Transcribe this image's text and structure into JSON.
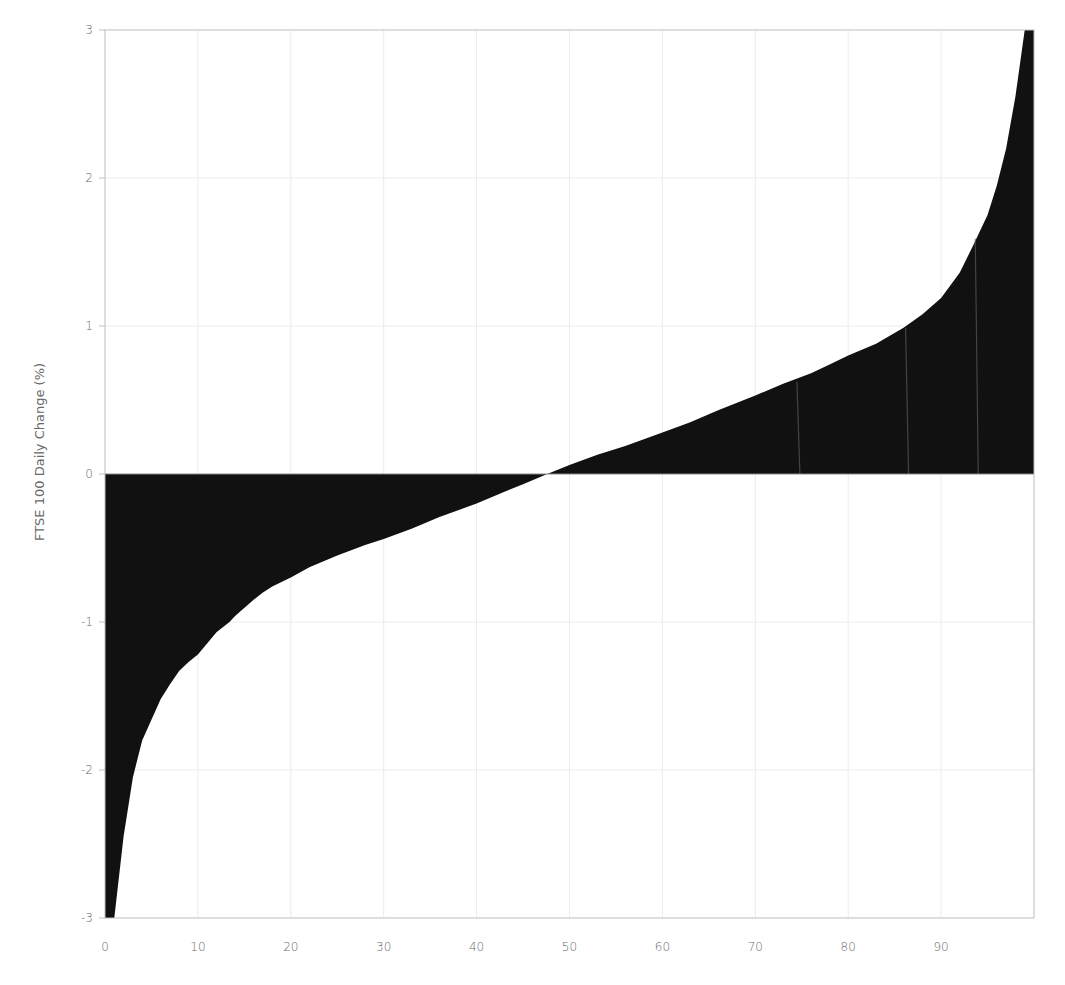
{
  "chart_data": {
    "type": "area",
    "title": "",
    "xlabel": "",
    "ylabel": "FTSE 100 Daily Change (%)",
    "xlim": [
      0,
      100
    ],
    "ylim": [
      -3,
      3
    ],
    "x_ticks": [
      0,
      10,
      20,
      30,
      40,
      50,
      60,
      70,
      80,
      90
    ],
    "x_tick_labels": [
      "0",
      "10",
      "20",
      "30",
      "40",
      "50",
      "60",
      "70",
      "80",
      "90"
    ],
    "y_ticks": [
      -3,
      -2,
      -1,
      0,
      1,
      2,
      3
    ],
    "y_tick_labels": [
      "-3",
      "-2",
      "-1",
      "0",
      "1",
      "2",
      "3"
    ],
    "grid": true,
    "legend": null,
    "fill_color": "#111111",
    "series": [
      {
        "name": "FTSE 100 Daily Change (%) sorted",
        "x": [
          1,
          2,
          3,
          4,
          5,
          6,
          7,
          8,
          9,
          10,
          12,
          13.4,
          14,
          16,
          17,
          18,
          20,
          22,
          25,
          28,
          30,
          33,
          36,
          40,
          43,
          45,
          47.6,
          50,
          53,
          56,
          60,
          63,
          66,
          70,
          73,
          76,
          78,
          80,
          83,
          86,
          88,
          90,
          92,
          93.5,
          95,
          96,
          97,
          98,
          99,
          100
        ],
        "values": [
          -3.0,
          -2.45,
          -2.05,
          -1.8,
          -1.66,
          -1.52,
          -1.42,
          -1.33,
          -1.27,
          -1.22,
          -1.07,
          -1.0,
          -0.96,
          -0.85,
          -0.8,
          -0.76,
          -0.7,
          -0.63,
          -0.55,
          -0.48,
          -0.44,
          -0.37,
          -0.29,
          -0.2,
          -0.12,
          -0.07,
          0.0,
          0.06,
          0.13,
          0.19,
          0.28,
          0.35,
          0.43,
          0.53,
          0.61,
          0.68,
          0.74,
          0.8,
          0.88,
          0.99,
          1.08,
          1.19,
          1.36,
          1.55,
          1.75,
          1.95,
          2.2,
          2.55,
          3.0,
          3.0
        ]
      }
    ]
  }
}
